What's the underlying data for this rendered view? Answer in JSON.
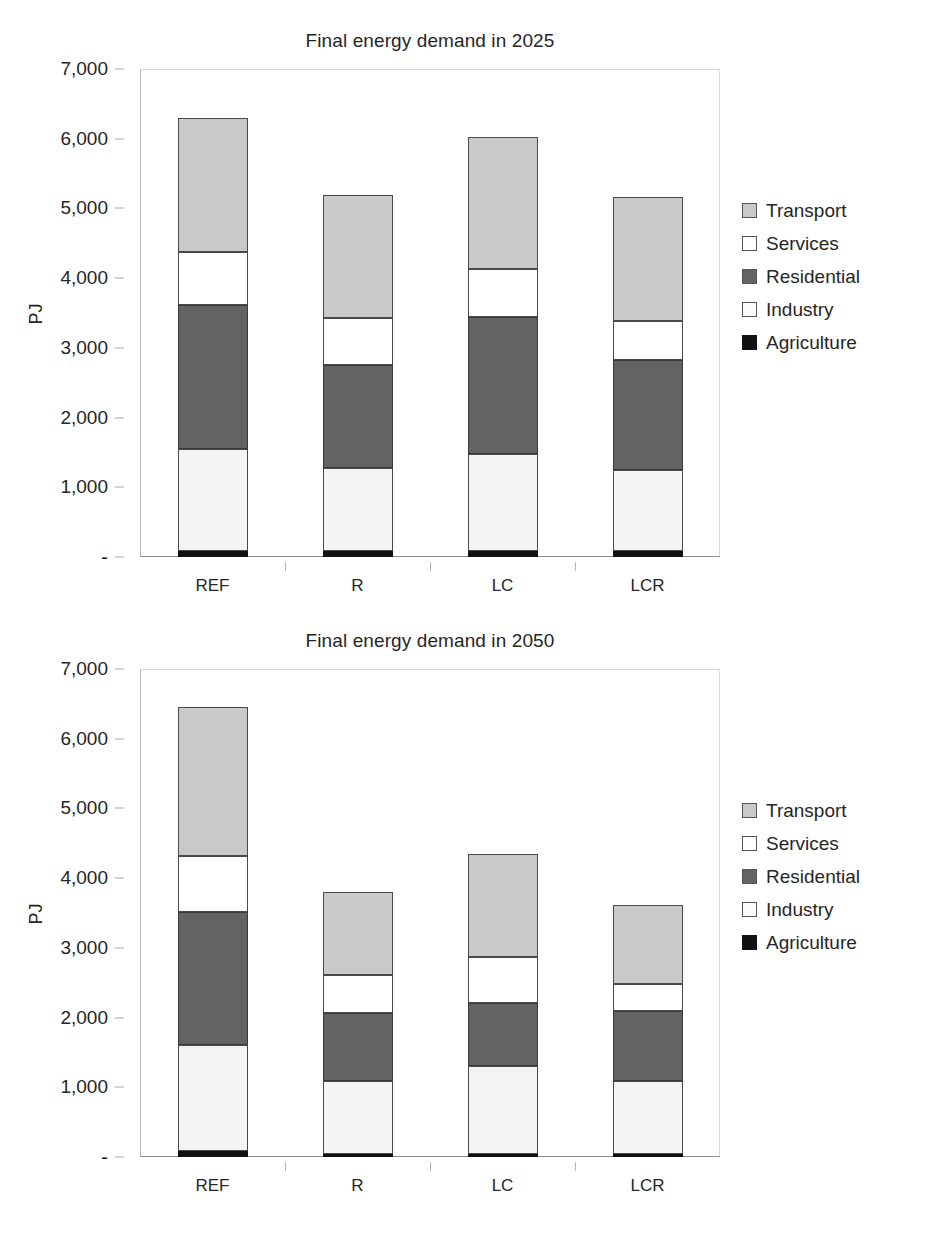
{
  "charts": [
    {
      "id": "chart-2025",
      "title": "Final energy demand in 2025",
      "ylabel": "PJ",
      "yticks": [
        "7,000",
        "6,000",
        "5,000",
        "4,000",
        "3,000",
        "2,000",
        "1,000",
        "-"
      ],
      "categories": [
        "REF",
        "R",
        "LC",
        "LCR"
      ],
      "legend": [
        {
          "label": "Transport",
          "key": "transport",
          "color": "#c9c9c9"
        },
        {
          "label": "Services",
          "key": "services",
          "color": "#ffffff"
        },
        {
          "label": "Residential",
          "key": "residential",
          "color": "#636363"
        },
        {
          "label": "Industry",
          "key": "industry",
          "color": "#fbfbfb"
        },
        {
          "label": "Agriculture",
          "key": "agriculture",
          "color": "#111111"
        }
      ]
    },
    {
      "id": "chart-2050",
      "title": "Final energy demand in 2050",
      "ylabel": "PJ",
      "yticks": [
        "7,000",
        "6,000",
        "5,000",
        "4,000",
        "3,000",
        "2,000",
        "1,000",
        "-"
      ],
      "categories": [
        "REF",
        "R",
        "LC",
        "LCR"
      ],
      "legend": [
        {
          "label": "Transport",
          "key": "transport",
          "color": "#c9c9c9"
        },
        {
          "label": "Services",
          "key": "services",
          "color": "#ffffff"
        },
        {
          "label": "Residential",
          "key": "residential",
          "color": "#636363"
        },
        {
          "label": "Industry",
          "key": "industry",
          "color": "#fbfbfb"
        },
        {
          "label": "Agriculture",
          "key": "agriculture",
          "color": "#111111"
        }
      ]
    }
  ],
  "chart_data": [
    {
      "type": "bar",
      "stacked": true,
      "title": "Final energy demand in 2025",
      "xlabel": "",
      "ylabel": "PJ",
      "ylim": [
        0,
        7000
      ],
      "ytick_values": [
        0,
        1000,
        2000,
        3000,
        4000,
        5000,
        6000,
        7000
      ],
      "ytick_labels": [
        "-",
        "1,000",
        "2,000",
        "3,000",
        "4,000",
        "5,000",
        "6,000",
        "7,000"
      ],
      "grid": false,
      "legend_position": "right",
      "categories": [
        "REF",
        "R",
        "LC",
        "LCR"
      ],
      "series": [
        {
          "name": "Agriculture",
          "values": [
            85,
            80,
            80,
            80
          ]
        },
        {
          "name": "Industry",
          "values": [
            1460,
            1195,
            1400,
            1175
          ]
        },
        {
          "name": "Residential",
          "values": [
            2075,
            1480,
            1965,
            1565
          ]
        },
        {
          "name": "Services",
          "values": [
            750,
            670,
            680,
            560
          ]
        },
        {
          "name": "Transport",
          "values": [
            1930,
            1775,
            1905,
            1780
          ]
        }
      ],
      "totals": [
        6300,
        5200,
        6030,
        5160
      ]
    },
    {
      "type": "bar",
      "stacked": true,
      "title": "Final energy demand in 2050",
      "xlabel": "",
      "ylabel": "PJ",
      "ylim": [
        0,
        7000
      ],
      "ytick_values": [
        0,
        1000,
        2000,
        3000,
        4000,
        5000,
        6000,
        7000
      ],
      "ytick_labels": [
        "-",
        "1,000",
        "2,000",
        "3,000",
        "4,000",
        "5,000",
        "6,000",
        "7,000"
      ],
      "grid": false,
      "legend_position": "right",
      "categories": [
        "REF",
        "R",
        "LC",
        "LCR"
      ],
      "series": [
        {
          "name": "Agriculture",
          "values": [
            80,
            40,
            50,
            45
          ]
        },
        {
          "name": "Industry",
          "values": [
            1520,
            1045,
            1250,
            1045
          ]
        },
        {
          "name": "Residential",
          "values": [
            1920,
            985,
            915,
            1000
          ]
        },
        {
          "name": "Services",
          "values": [
            800,
            535,
            650,
            390
          ]
        },
        {
          "name": "Transport",
          "values": [
            2130,
            1195,
            1475,
            1140
          ]
        }
      ],
      "totals": [
        6450,
        3800,
        4340,
        3620
      ]
    }
  ]
}
